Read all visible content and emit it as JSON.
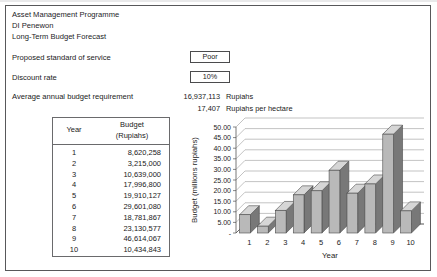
{
  "document": {
    "title_lines": [
      "Asset Management Programme",
      "DI Penewon",
      "Long-Term Budget Forecast"
    ],
    "fields": [
      {
        "label": "Proposed standard of service",
        "value": "Poor"
      },
      {
        "label": "Discount rate",
        "value": "10%"
      }
    ],
    "average": {
      "label": "Average annual budget requirement",
      "rows": [
        {
          "number": "16,937,113",
          "unit": "Rupiahs"
        },
        {
          "number": "17,407",
          "unit": "Rupiahs per hectare"
        }
      ]
    }
  },
  "table": {
    "headers": {
      "year": "Year",
      "budget_line1": "Budget",
      "budget_line2": "(Rupiahs)"
    },
    "rows": [
      {
        "year": "1",
        "budget": "8,620,258"
      },
      {
        "year": "2",
        "budget": "3,215,000"
      },
      {
        "year": "3",
        "budget": "10,639,000"
      },
      {
        "year": "4",
        "budget": "17,996,800"
      },
      {
        "year": "5",
        "budget": "19,910,127"
      },
      {
        "year": "6",
        "budget": "29,601,080"
      },
      {
        "year": "7",
        "budget": "18,781,867"
      },
      {
        "year": "8",
        "budget": "23,130,577"
      },
      {
        "year": "9",
        "budget": "46,614,067"
      },
      {
        "year": "10",
        "budget": "10,434,843"
      }
    ]
  },
  "chart_data": {
    "type": "bar",
    "title": "",
    "xlabel": "Year",
    "ylabel": "Budget (millions rupiahs)",
    "categories": [
      "1",
      "2",
      "3",
      "4",
      "5",
      "6",
      "7",
      "8",
      "9",
      "10"
    ],
    "values": [
      8.620258,
      3.215,
      10.639,
      17.9968,
      19.910127,
      29.60108,
      18.781867,
      23.130577,
      46.614067,
      10.434843
    ],
    "ylim": [
      0,
      50
    ],
    "ytick_labels": [
      "-",
      "5.00",
      "10.00",
      "15.00",
      "20.00",
      "25.00",
      "30.00",
      "35.00",
      "40.00",
      "45.00",
      "50.00"
    ],
    "ytick_values": [
      0,
      5,
      10,
      15,
      20,
      25,
      30,
      35,
      40,
      45,
      50
    ],
    "grid": true,
    "legend": false,
    "style": "3d-column",
    "colors": {
      "bar_front": "#b9b9b9",
      "bar_side": "#787878",
      "bar_top": "#d6d6d6",
      "bar_edge": "#4a4a4a",
      "grid": "#9a9a9a",
      "axis": "#555555"
    }
  }
}
